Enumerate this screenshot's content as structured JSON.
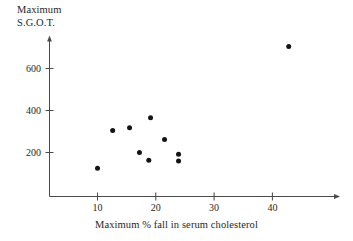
{
  "chart_data": {
    "type": "scatter",
    "title": "",
    "xlabel": "Maximum % fall in serum cholesterol",
    "ylabel_line1": "Maximum",
    "ylabel_line2": "S.G.O.T.",
    "ylabel": "Maximum S.G.O.T.",
    "xlim": [
      0,
      48
    ],
    "ylim": [
      0,
      760
    ],
    "grid": false,
    "legend": "none",
    "xticks": [
      10,
      20,
      30,
      40
    ],
    "xtick_labels": [
      "10",
      "20",
      "30",
      "40"
    ],
    "yticks": [
      200,
      400,
      600
    ],
    "ytick_labels": [
      "200",
      "400",
      "600"
    ],
    "marker": "filled-circle",
    "marker_color": "#141414",
    "axis_color": "#4a4a4a",
    "points": [
      {
        "x": 10.0,
        "y": 125
      },
      {
        "x": 12.6,
        "y": 305
      },
      {
        "x": 15.5,
        "y": 318
      },
      {
        "x": 17.2,
        "y": 200
      },
      {
        "x": 18.8,
        "y": 163
      },
      {
        "x": 19.1,
        "y": 365
      },
      {
        "x": 21.5,
        "y": 262
      },
      {
        "x": 23.9,
        "y": 192
      },
      {
        "x": 23.9,
        "y": 160
      },
      {
        "x": 42.8,
        "y": 705
      }
    ]
  },
  "axes": {
    "y_arrow": "up-arrow-icon",
    "x_arrow": "right-arrow-icon"
  }
}
